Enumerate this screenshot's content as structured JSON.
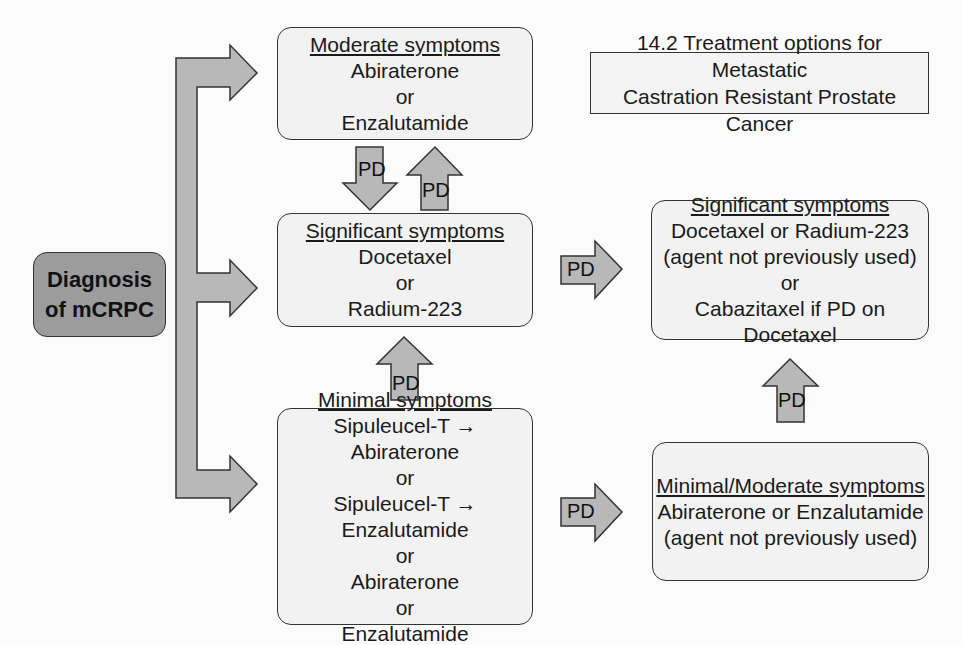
{
  "title": {
    "line1": "14.2 Treatment options for Metastatic",
    "line2": "Castration Resistant Prostate Cancer"
  },
  "diagnosis": {
    "line1": "Diagnosis",
    "line2": "of mCRPC"
  },
  "moderate": {
    "heading": "Moderate symptoms",
    "lines": [
      "Abiraterone",
      "or",
      "Enzalutamide"
    ]
  },
  "significant": {
    "heading": "Significant symptoms",
    "lines": [
      "Docetaxel",
      "or",
      "Radium-223"
    ]
  },
  "minimal": {
    "heading": "Minimal symptoms",
    "lines": [
      "Sipuleucel-T → Abiraterone",
      "or",
      "Sipuleucel-T → Enzalutamide",
      "or",
      "Abiraterone",
      "or",
      "Enzalutamide"
    ]
  },
  "significant_next": {
    "heading": "Significant symptoms",
    "lines": [
      "Docetaxel or Radium-223",
      "(agent not previously used)",
      "or",
      "Cabazitaxel if PD on Docetaxel"
    ]
  },
  "minimal_next": {
    "heading": "Minimal/Moderate symptoms",
    "lines": [
      "Abiraterone or Enzalutamide",
      "(agent not previously used)"
    ]
  },
  "arrow_label": "PD",
  "colors": {
    "arrow_fill": "#b8b8b8",
    "diagnosis_fill": "#9c9c9c",
    "box_fill": "#f2f2f2",
    "stroke": "#333333"
  }
}
